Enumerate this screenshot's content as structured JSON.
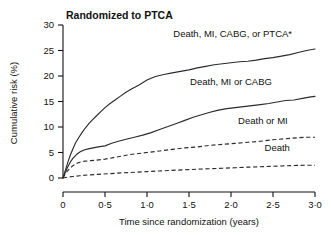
{
  "chart_data": {
    "type": "line",
    "title": "Randomized to PTCA",
    "xlabel": "Time since randomization (years)",
    "ylabel": "Cumulative risk (%)",
    "xlim": [
      0,
      3.0
    ],
    "ylim": [
      0,
      30
    ],
    "xticks": [
      0,
      0.5,
      1.0,
      1.5,
      2.0,
      2.5,
      3.0
    ],
    "xticklabels": [
      "0",
      "0·0",
      "1·0",
      "1·5",
      "2·0",
      "2·5",
      "3·0"
    ],
    "yticks": [
      0,
      5,
      10,
      15,
      20,
      25,
      30
    ],
    "yticklabels": [
      "0",
      "5",
      "10",
      "15",
      "20",
      "25",
      "30"
    ],
    "grid": false,
    "legend_position": "inline-annotations",
    "series": [
      {
        "name": "Death, MI, CABG, or PTCA*",
        "style": "solid",
        "label_x": 2.02,
        "label_y": 27.6,
        "x": [
          0,
          0.03,
          0.06,
          0.09,
          0.12,
          0.15,
          0.19,
          0.23,
          0.27,
          0.31,
          0.35,
          0.4,
          0.45,
          0.5,
          0.56,
          0.62,
          0.68,
          0.75,
          0.82,
          0.9,
          1.0,
          1.1,
          1.2,
          1.3,
          1.4,
          1.5,
          1.6,
          1.7,
          1.8,
          1.9,
          2.0,
          2.1,
          2.2,
          2.3,
          2.4,
          2.5,
          2.6,
          2.7,
          2.8,
          2.9,
          3.0
        ],
        "y": [
          0,
          1.6,
          3.2,
          4.6,
          5.8,
          6.9,
          8.0,
          9.0,
          9.9,
          10.7,
          11.4,
          12.2,
          13.0,
          13.8,
          14.6,
          15.3,
          16.0,
          16.8,
          17.5,
          18.2,
          19.2,
          19.9,
          20.3,
          20.6,
          20.9,
          21.2,
          21.6,
          21.9,
          22.2,
          22.4,
          22.6,
          22.8,
          22.9,
          23.1,
          23.4,
          23.6,
          23.9,
          24.2,
          24.6,
          25.0,
          25.3
        ]
      },
      {
        "name": "Death, MI or  CABG",
        "style": "solid",
        "label_x": 2.0,
        "label_y": 18.3,
        "x": [
          0,
          0.03,
          0.06,
          0.09,
          0.12,
          0.16,
          0.2,
          0.25,
          0.3,
          0.36,
          0.42,
          0.5,
          0.58,
          0.66,
          0.75,
          0.85,
          0.95,
          1.05,
          1.15,
          1.25,
          1.35,
          1.45,
          1.55,
          1.65,
          1.75,
          1.85,
          1.95,
          2.05,
          2.15,
          2.25,
          2.35,
          2.45,
          2.55,
          2.65,
          2.75,
          2.85,
          2.95,
          3.0
        ],
        "y": [
          0,
          1.2,
          2.3,
          3.2,
          3.9,
          4.6,
          5.1,
          5.5,
          5.7,
          5.9,
          6.1,
          6.3,
          6.8,
          7.2,
          7.6,
          8.0,
          8.4,
          8.9,
          9.5,
          10.1,
          10.7,
          11.3,
          11.9,
          12.4,
          12.9,
          13.3,
          13.6,
          13.8,
          14.0,
          14.2,
          14.4,
          14.6,
          14.9,
          15.2,
          15.3,
          15.6,
          15.9,
          16.0
        ]
      },
      {
        "name": "Death or MI",
        "style": "dashed",
        "label_x": 2.38,
        "label_y": 10.6,
        "x": [
          0,
          0.03,
          0.07,
          0.11,
          0.15,
          0.2,
          0.26,
          0.33,
          0.4,
          0.5,
          0.6,
          0.7,
          0.8,
          0.9,
          1.0,
          1.15,
          1.3,
          1.45,
          1.6,
          1.75,
          1.9,
          2.05,
          2.2,
          2.35,
          2.5,
          2.65,
          2.8,
          2.9,
          3.0
        ],
        "y": [
          0,
          0.9,
          1.7,
          2.3,
          2.8,
          3.1,
          3.3,
          3.4,
          3.5,
          3.7,
          4.0,
          4.3,
          4.6,
          4.8,
          5.0,
          5.3,
          5.6,
          5.9,
          6.1,
          6.4,
          6.6,
          6.8,
          7.0,
          7.2,
          7.5,
          7.7,
          7.9,
          8.0,
          8.0
        ]
      },
      {
        "name": "Death",
        "style": "dashed",
        "label_x": 2.55,
        "label_y": 5.3,
        "x": [
          0,
          0.05,
          0.12,
          0.2,
          0.3,
          0.42,
          0.55,
          0.7,
          0.85,
          1.0,
          1.15,
          1.3,
          1.45,
          1.6,
          1.75,
          1.9,
          2.05,
          2.2,
          2.35,
          2.5,
          2.65,
          2.8,
          2.9,
          3.0
        ],
        "y": [
          0,
          0.15,
          0.3,
          0.45,
          0.6,
          0.72,
          0.85,
          1.0,
          1.12,
          1.25,
          1.38,
          1.5,
          1.62,
          1.72,
          1.82,
          1.92,
          2.02,
          2.12,
          2.2,
          2.3,
          2.4,
          2.48,
          2.5,
          2.5
        ]
      }
    ]
  },
  "colors": {
    "curve": "#2b2b2b",
    "axis": "#111111",
    "background": "#ffffff"
  }
}
